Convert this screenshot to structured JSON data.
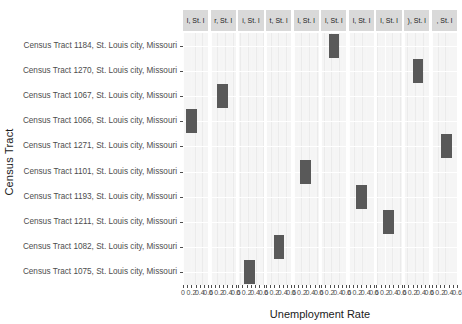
{
  "chart_data": {
    "type": "bar",
    "title": "",
    "xlabel": "Unemployment Rate",
    "ylabel": "Census Tract",
    "orientation": "horizontal",
    "faceted": true,
    "facet_count": 10,
    "grid": true,
    "legend": "none",
    "xlim": [
      0,
      0.6
    ],
    "xticks": [
      0,
      0.2,
      0.4,
      0.6
    ],
    "xtick_labels": [
      "0",
      "0.2",
      "0.4",
      "0.6"
    ],
    "xtick_minor": [
      0.1,
      0.3,
      0.5
    ],
    "bar_color": "#595959",
    "panel_background": "#ebebeb",
    "strip_background": "#d9d9d9",
    "categories": [
      "Census Tract 1184, St. Louis city, Missouri",
      "Census Tract 1270, St. Louis city, Missouri",
      "Census Tract 1067, St. Louis city, Missouri",
      "Census Tract 1066, St. Louis city, Missouri",
      "Census Tract 1271, St. Louis city, Missouri",
      "Census Tract 1101, St. Louis city, Missouri",
      "Census Tract 1193, St. Louis city, Missouri",
      "Census Tract 1211, St. Louis city, Missouri",
      "Census Tract 1082, St. Louis city, Missouri",
      "Census Tract 1075, St. Louis city, Missouri"
    ],
    "facet_labels": [
      "l, St. l",
      "r, St. l",
      "i, St. l",
      "t, St. l",
      "l, St. l",
      "l, St. l",
      "l, St. l",
      "l, St. l",
      "), St. l",
      ", St. l"
    ],
    "series": [
      {
        "facet": 0,
        "category": "Census Tract 1066, St. Louis city, Missouri",
        "row": 3,
        "value": 0.22
      },
      {
        "facet": 1,
        "category": "Census Tract 1067, St. Louis city, Missouri",
        "row": 2,
        "value": 0.3
      },
      {
        "facet": 2,
        "category": "Census Tract 1075, St. Louis city, Missouri",
        "row": 9,
        "value": 0.28
      },
      {
        "facet": 3,
        "category": "Census Tract 1082, St. Louis city, Missouri",
        "row": 8,
        "value": 0.32
      },
      {
        "facet": 4,
        "category": "Census Tract 1101, St. Louis city, Missouri",
        "row": 5,
        "value": 0.3
      },
      {
        "facet": 5,
        "category": "Census Tract 1184, St. Louis city, Missouri",
        "row": 0,
        "value": 0.32
      },
      {
        "facet": 6,
        "category": "Census Tract 1193, St. Louis city, Missouri",
        "row": 6,
        "value": 0.32
      },
      {
        "facet": 7,
        "category": "Census Tract 1211, St. Louis city, Missouri",
        "row": 7,
        "value": 0.3
      },
      {
        "facet": 8,
        "category": "Census Tract 1270, St. Louis city, Missouri",
        "row": 1,
        "value": 0.34
      },
      {
        "facet": 9,
        "category": "Census Tract 1271, St. Louis city, Missouri",
        "row": 4,
        "value": 0.36
      }
    ]
  },
  "axes": {
    "x_title": "Unemployment Rate",
    "y_title": "Census Tract"
  }
}
